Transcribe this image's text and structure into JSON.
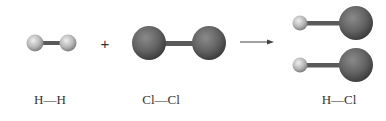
{
  "reaction": {
    "reactants": [
      {
        "id": "h2",
        "label": "H—H",
        "atoms": [
          "H",
          "H"
        ]
      },
      {
        "id": "cl2",
        "label": "Cl—Cl",
        "atoms": [
          "Cl",
          "Cl"
        ]
      }
    ],
    "operator": "+",
    "arrow": "→",
    "products": [
      {
        "id": "hcl",
        "label": "H—Cl",
        "count": 2,
        "atoms": [
          "H",
          "Cl"
        ]
      }
    ]
  },
  "colors": {
    "hydrogen": "#c8c8c8",
    "chlorine": "#6a6a6a",
    "bond": "#5a5a5a",
    "text": "#333333"
  }
}
